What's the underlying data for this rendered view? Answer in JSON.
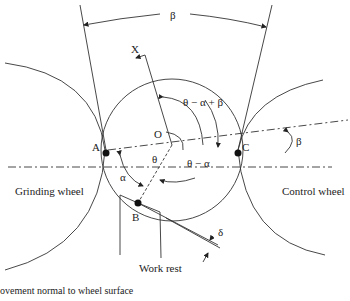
{
  "diagram": {
    "type": "centerless grinding geometry",
    "points": {
      "A": "A",
      "B": "B",
      "C": "C",
      "O": "O",
      "X": "X"
    },
    "angles": {
      "beta_top": "β",
      "beta_right": "β",
      "theta_alpha_beta": "θ − α + β",
      "theta_alpha": "θ − α",
      "theta": "θ",
      "alpha": "α",
      "delta": "δ"
    },
    "labels": {
      "grinding_wheel": "Grinding wheel",
      "control_wheel": "Control wheel",
      "work_rest": "Work rest",
      "caption": "ovement normal to wheel surface"
    }
  }
}
